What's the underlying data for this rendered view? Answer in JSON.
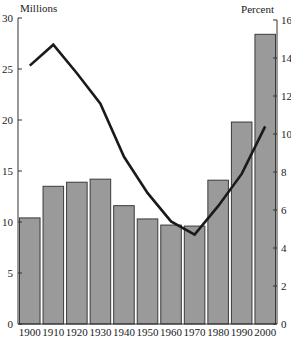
{
  "chart_data": {
    "type": "bar+line",
    "title": "",
    "categories": [
      "1900",
      "1910",
      "1920",
      "1930",
      "1940",
      "1950",
      "1960",
      "1970",
      "1980",
      "1990",
      "2000"
    ],
    "series": [
      {
        "name": "Foreign-born population (Millions)",
        "type": "bar",
        "axis": "left",
        "values": [
          10.4,
          13.5,
          13.9,
          14.2,
          11.6,
          10.3,
          9.7,
          9.6,
          14.1,
          19.8,
          28.4
        ]
      },
      {
        "name": "Percent of total population",
        "type": "line",
        "axis": "right",
        "values": [
          13.6,
          14.7,
          13.2,
          11.6,
          8.8,
          6.9,
          5.4,
          4.7,
          6.2,
          7.9,
          10.4
        ]
      }
    ],
    "xlabel": "",
    "ylabel_left": "Millions",
    "ylabel_right": "Percent",
    "ylim_left": [
      0,
      30
    ],
    "ylim_right": [
      0,
      16
    ],
    "yticks_left": [
      0,
      5,
      10,
      15,
      20,
      25,
      30
    ],
    "yticks_right": [
      0,
      2,
      4,
      6,
      8,
      10,
      12,
      14,
      16
    ],
    "grid": false,
    "legend": "none",
    "colors": {
      "bar_fill": "#9a9a9a",
      "bar_stroke": "#3a3a3a",
      "line": "#1a1a1a",
      "axis": "#333333"
    }
  }
}
